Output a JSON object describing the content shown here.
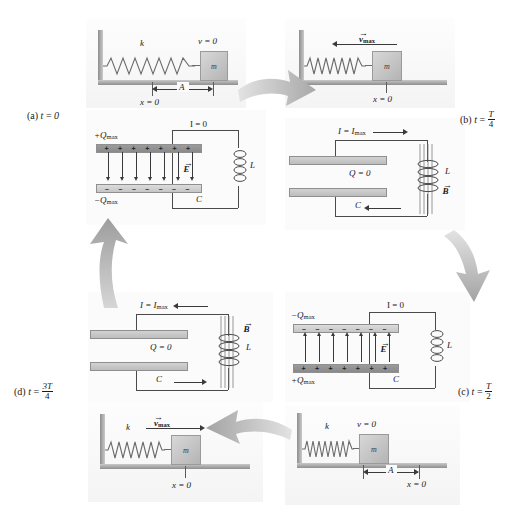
{
  "figure": {
    "accent_gray": "#9b9b9b",
    "plate_dark": "#9b9b9b",
    "plate_light": "#dcdcdc"
  },
  "panels": [
    {
      "id": "a",
      "corner_label": "(a)",
      "time_var": "t",
      "time_equals": "=",
      "time_value": "0",
      "time_is_fraction": false,
      "spring": {
        "spring_constant_label": "k",
        "mass_label": "m",
        "velocity_label": "v = 0",
        "velocity_is_vector": false,
        "amplitude_label": "A",
        "origin_label": "x = 0",
        "state": "stretched-right"
      },
      "circuit": {
        "current_label": "I = 0",
        "top_charge_label": "+Q",
        "top_charge_sub": "max",
        "bottom_charge_label": "−Q",
        "bottom_charge_sub": "max",
        "top_plate_sign": "+",
        "bottom_plate_sign": "−",
        "charge_count": 7,
        "field_label": "E",
        "field_vector": true,
        "field_direction": "down",
        "capacitor_label": "C",
        "inductor_label": "L",
        "b_field_label": "",
        "has_b_field": false,
        "charge_label_present": false,
        "q_zero_label": ""
      }
    },
    {
      "id": "b",
      "corner_label": "(b)",
      "time_var": "t",
      "time_equals": "=",
      "time_value": "T/4",
      "time_is_fraction": true,
      "time_numerator": "T",
      "time_denominator": "4",
      "spring": {
        "spring_constant_label": "",
        "mass_label": "m",
        "velocity_label": "v",
        "velocity_sub": "max",
        "velocity_is_vector": true,
        "velocity_direction": "left",
        "amplitude_label": "",
        "origin_label": "x = 0",
        "state": "at-origin-moving-left"
      },
      "circuit": {
        "current_label": "I = I",
        "current_sub": "max",
        "current_direction_top": "right",
        "current_direction_bottom": "left",
        "q_zero_label": "Q = 0",
        "capacitor_label": "C",
        "inductor_label": "L",
        "b_field_label": "B",
        "has_b_field": true,
        "field_label": "",
        "charge_count": 0
      }
    },
    {
      "id": "c",
      "corner_label": "(c)",
      "time_var": "t",
      "time_equals": "=",
      "time_value": "T/2",
      "time_is_fraction": true,
      "time_numerator": "T",
      "time_denominator": "2",
      "spring": {
        "spring_constant_label": "k",
        "mass_label": "m",
        "velocity_label": "v = 0",
        "velocity_is_vector": false,
        "amplitude_label": "A",
        "origin_label": "x = 0",
        "state": "compressed-left"
      },
      "circuit": {
        "current_label": "I = 0",
        "top_charge_label": "−Q",
        "top_charge_sub": "max",
        "bottom_charge_label": "+Q",
        "bottom_charge_sub": "max",
        "top_plate_sign": "−",
        "bottom_plate_sign": "+",
        "charge_count": 7,
        "field_label": "E",
        "field_vector": true,
        "field_direction": "up",
        "capacitor_label": "C",
        "inductor_label": "L",
        "has_b_field": false,
        "q_zero_label": ""
      }
    },
    {
      "id": "d",
      "corner_label": "(d)",
      "time_var": "t",
      "time_equals": "=",
      "time_value": "3T/4",
      "time_is_fraction": true,
      "time_numerator": "3T",
      "time_denominator": "4",
      "spring": {
        "spring_constant_label": "k",
        "mass_label": "m",
        "velocity_label": "v",
        "velocity_sub": "max",
        "velocity_is_vector": true,
        "velocity_direction": "right",
        "amplitude_label": "",
        "origin_label": "x = 0",
        "state": "at-origin-moving-right"
      },
      "circuit": {
        "current_label": "I = I",
        "current_sub": "max",
        "current_direction_top": "left",
        "current_direction_bottom": "right",
        "q_zero_label": "Q = 0",
        "capacitor_label": "C",
        "inductor_label": "L",
        "b_field_label": "B",
        "has_b_field": true,
        "field_label": "",
        "charge_count": 0
      }
    }
  ],
  "flow_arrows": [
    {
      "name": "arrow-a-to-b",
      "direction": "right-down"
    },
    {
      "name": "arrow-b-to-c",
      "direction": "down-right"
    },
    {
      "name": "arrow-c-to-d",
      "direction": "left"
    },
    {
      "name": "arrow-d-to-a",
      "direction": "up"
    }
  ]
}
